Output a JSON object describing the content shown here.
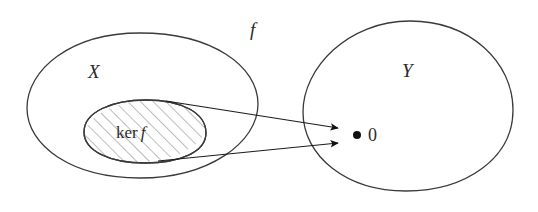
{
  "figure": {
    "kind": "set-mapping-diagram",
    "background": "#ffffff",
    "stroke_color": "#3a3a3a",
    "hatch_color": "#7a7a7a",
    "text_color": "#2b2b2b",
    "width": 538,
    "height": 212
  },
  "labels": {
    "domain_set": "X",
    "codomain_set": "Y",
    "map": "f",
    "kernel_prefix": "ker",
    "kernel_map": "f",
    "zero_element": "0"
  },
  "shapes": {
    "domain_blob": {
      "name": "X",
      "center_x": 143,
      "center_y": 105,
      "radius_x": 116,
      "radius_y": 73
    },
    "kernel_blob": {
      "name": "ker f",
      "center_x": 145,
      "center_y": 131,
      "radius_x": 61,
      "radius_y": 31,
      "hatched": true,
      "hatch_angle_deg": 45,
      "hatch_spacing_px": 9
    },
    "codomain_blob": {
      "name": "Y",
      "center_x": 408,
      "center_y": 105,
      "radius_x": 106,
      "radius_y": 85
    },
    "zero_point": {
      "x": 357,
      "y": 135,
      "radius": 4
    }
  },
  "arrows": [
    {
      "name": "kernel-top-to-zero",
      "x1": 166,
      "y1": 102,
      "x2": 344,
      "y2": 128
    },
    {
      "name": "kernel-bottom-to-zero",
      "x1": 160,
      "y1": 160,
      "x2": 344,
      "y2": 143
    }
  ]
}
